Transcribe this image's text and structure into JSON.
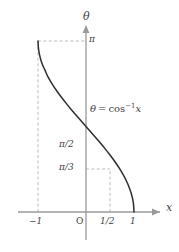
{
  "figure": {
    "background_color": "#ffffff",
    "axis_color": "#9a9a9a",
    "curve_color": "#2e2e2e",
    "guide_color": "#a8a8a8",
    "text_color": "#3f3f3f"
  },
  "axes": {
    "x_axis_label": "x",
    "y_axis_label": "θ",
    "x_ticks": [
      {
        "label": "−1",
        "value": -1
      },
      {
        "label": "O",
        "value": 0
      },
      {
        "label": "1/2",
        "value": 0.5
      },
      {
        "label": "1",
        "value": 1
      }
    ],
    "y_ticks": [
      {
        "label": "π/3",
        "value": 1.0472
      },
      {
        "label": "π/2",
        "value": 1.5708
      },
      {
        "label": "π",
        "value": 3.1416
      }
    ]
  },
  "annotations": {
    "equation": {
      "lhs": "θ",
      "equals": "=",
      "function": "cos",
      "exponent": "−1",
      "argument": "x",
      "full_text": "θ = cos⁻¹x"
    }
  },
  "guides": [
    {
      "name": "pi-horizontal",
      "from": [
        -1,
        3.1416
      ],
      "to": [
        0,
        3.1416
      ]
    },
    {
      "name": "neg-one-vertical",
      "from": [
        -1,
        0
      ],
      "to": [
        -1,
        3.1416
      ]
    },
    {
      "name": "pi-third-horizontal",
      "from": [
        0,
        1.0472
      ],
      "to": [
        0.5,
        1.0472
      ]
    },
    {
      "name": "half-vertical",
      "from": [
        0.5,
        0
      ],
      "to": [
        0.5,
        1.0472
      ]
    }
  ],
  "chart_data": {
    "type": "line",
    "title": "",
    "xlabel": "x",
    "ylabel": "θ",
    "xlim": [
      -1.25,
      1.25
    ],
    "ylim": [
      0,
      3.45
    ],
    "grid": false,
    "legend": null,
    "series": [
      {
        "name": "θ = cos⁻¹x",
        "x": [
          -1,
          -0.99,
          -0.97,
          -0.94,
          -0.9,
          -0.85,
          -0.8,
          -0.7,
          -0.6,
          -0.5,
          -0.4,
          -0.3,
          -0.2,
          -0.1,
          0,
          0.1,
          0.2,
          0.3,
          0.4,
          0.5,
          0.6,
          0.7,
          0.8,
          0.85,
          0.9,
          0.94,
          0.97,
          0.99,
          1
        ],
        "y": [
          3.1416,
          3.0002,
          2.8966,
          2.7934,
          2.6906,
          2.598,
          2.4981,
          2.3462,
          2.2143,
          2.0944,
          1.9823,
          1.8755,
          1.7722,
          1.671,
          1.5708,
          1.4706,
          1.3694,
          1.2661,
          1.1593,
          1.0472,
          0.9273,
          0.7954,
          0.6435,
          0.5548,
          0.451,
          0.3478,
          0.2449,
          0.1415,
          0
        ]
      }
    ],
    "marked_points": [
      {
        "x": -1,
        "y": 3.1416,
        "label": "(−1, π)"
      },
      {
        "x": 0,
        "y": 1.5708,
        "label": "(0, π/2)"
      },
      {
        "x": 0.5,
        "y": 1.0472,
        "label": "(1/2, π/3)"
      },
      {
        "x": 1,
        "y": 0,
        "label": "(1, 0)"
      }
    ]
  }
}
